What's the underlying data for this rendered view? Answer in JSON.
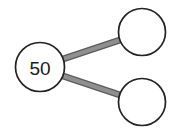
{
  "diagram": {
    "type": "number-bond",
    "background_color": "#ffffff",
    "node_stroke_color": "#222222",
    "node_fill_color": "#ffffff",
    "node_stroke_width": 1.6,
    "connector_color": "#8a8a8a",
    "connector_edge_color": "#5c5c5c",
    "connector_width": 5,
    "text_color": "#1a1a1a",
    "nodes": [
      {
        "id": "whole",
        "label": "50",
        "role": "whole",
        "cx": 40,
        "cy": 67,
        "r": 24.5,
        "filled": true
      },
      {
        "id": "part-top",
        "label": "",
        "role": "part",
        "cx": 142,
        "cy": 32,
        "r": 23.5,
        "filled": false
      },
      {
        "id": "part-bottom",
        "label": "",
        "role": "part",
        "cx": 142,
        "cy": 102,
        "r": 23.5,
        "filled": false
      }
    ],
    "connectors": [
      {
        "id": "whole-to-part-top",
        "from": "whole",
        "to": "part-top",
        "x1": 63,
        "y1": 59,
        "x2": 120,
        "y2": 40
      },
      {
        "id": "whole-to-part-bottom",
        "from": "whole",
        "to": "part-bottom",
        "x1": 63,
        "y1": 76,
        "x2": 120,
        "y2": 95
      }
    ]
  }
}
